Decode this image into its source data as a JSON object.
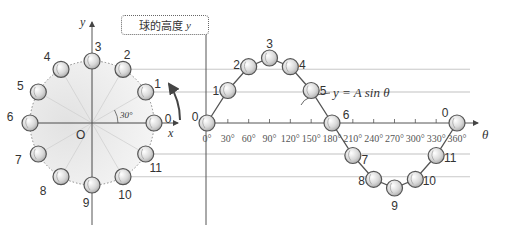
{
  "box_label": {
    "text": "球的高度",
    "var": "y"
  },
  "circle": {
    "axis_x": "x",
    "axis_y": "y",
    "origin": "O",
    "angle_label": "30°",
    "point_labels": [
      "0",
      "1",
      "2",
      "3",
      "4",
      "5",
      "6",
      "7",
      "8",
      "9",
      "10",
      "11"
    ]
  },
  "graph": {
    "axis_theta": "θ",
    "formula": "y = A sin θ",
    "ticks": [
      "0°",
      "30°",
      "60°",
      "90°",
      "120°",
      "150°",
      "180°",
      "210°",
      "240°",
      "270°",
      "300°",
      "330°",
      "360°"
    ],
    "point_labels": [
      "0",
      "1",
      "2",
      "3",
      "4",
      "5",
      "6",
      "7",
      "8",
      "9",
      "10",
      "11",
      "0"
    ]
  },
  "colors": {
    "ball_fill": "#dcdcdc",
    "ball_stroke": "#555555",
    "disk_fill": "#e6e6e6",
    "line": "#666666"
  }
}
